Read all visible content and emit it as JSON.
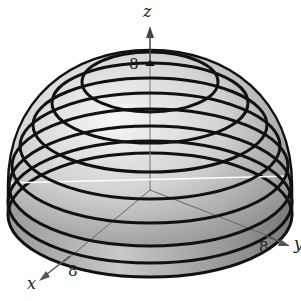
{
  "figure": {
    "type": "hemisphere-with-level-curves",
    "axes": {
      "x": {
        "label": "x",
        "tick": "8"
      },
      "y": {
        "label": "y",
        "tick": "8"
      },
      "z": {
        "label": "z",
        "tick": "8"
      }
    },
    "ring_count": 7,
    "colors": {
      "surface_light": "#f2f2f2",
      "surface_dark": "#8a8a8a",
      "rings": "#111111",
      "axes": "#555555"
    }
  }
}
